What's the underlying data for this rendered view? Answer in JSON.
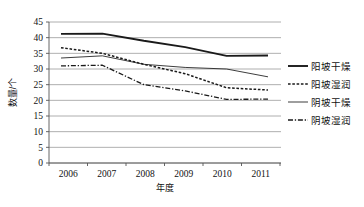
{
  "chart_data": {
    "type": "line",
    "title": "",
    "xlabel": "年度",
    "ylabel": "数量/个",
    "categories": [
      "2006",
      "2007",
      "2008",
      "2009",
      "2010",
      "2011"
    ],
    "xlim": [
      2006,
      2011
    ],
    "ylim": [
      0,
      45
    ],
    "ytick_step": 5,
    "yticks": [
      "0",
      "5",
      "10",
      "15",
      "20",
      "25",
      "30",
      "35",
      "40",
      "45"
    ],
    "grid": true,
    "legend_position": "right",
    "series": [
      {
        "name": "阳坡干燥",
        "style": "solid-thick",
        "color": "#1a1a1a",
        "values": [
          41.2,
          41.3,
          39.0,
          37.0,
          34.2,
          34.3
        ]
      },
      {
        "name": "阳坡湿润",
        "style": "dotted",
        "color": "#1a1a1a",
        "values": [
          36.8,
          35.0,
          31.5,
          28.5,
          24.0,
          23.3
        ]
      },
      {
        "name": "阴坡干燥",
        "style": "solid-thin",
        "color": "#1a1a1a",
        "values": [
          33.5,
          34.2,
          31.5,
          30.5,
          30.0,
          27.5
        ]
      },
      {
        "name": "阴坡湿润",
        "style": "dash-dot",
        "color": "#1a1a1a",
        "values": [
          31.0,
          31.2,
          25.0,
          23.0,
          20.3,
          20.4
        ]
      }
    ]
  },
  "legend": {
    "items": [
      {
        "label": "阳坡干燥",
        "style": "solid-thick"
      },
      {
        "label": "阳坡湿润",
        "style": "dotted"
      },
      {
        "label": "阴坡干燥",
        "style": "solid-thin"
      },
      {
        "label": "阴坡湿润",
        "style": "dash-dot"
      }
    ]
  },
  "colors": {
    "ink": "#1a1a1a",
    "grid": "#9a9a9a",
    "axis": "#555555",
    "background": "#ffffff"
  }
}
